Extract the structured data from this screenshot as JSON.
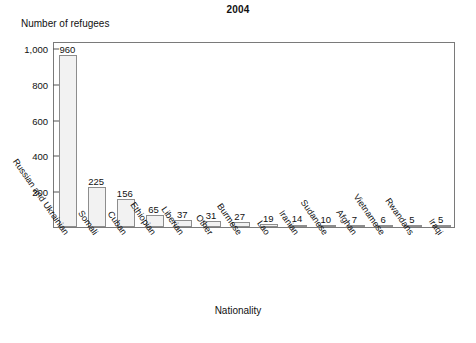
{
  "chart_data": {
    "type": "bar",
    "title": "2004",
    "xlabel": "Nationality",
    "ylabel": "Number of refugees",
    "ylim": [
      0,
      1040
    ],
    "yticks": [
      200,
      400,
      600,
      800,
      1000
    ],
    "ytick_labels": [
      "200",
      "400",
      "600",
      "800",
      "1,000"
    ],
    "grid": false,
    "legend": null,
    "categories": [
      "Russian and Ukrainian",
      "Somali",
      "Cuban",
      "Ethiopian",
      "Liberian",
      "Other",
      "Burmese",
      "Lao",
      "Iranian",
      "Sudanese",
      "Afghan",
      "Vietnamese",
      "Rwandans",
      "Iraqi"
    ],
    "values": [
      960,
      225,
      156,
      65,
      37,
      31,
      27,
      19,
      14,
      10,
      7,
      6,
      5,
      5
    ],
    "value_labels": [
      "960",
      "225",
      "156",
      "65",
      "37",
      "31",
      "27",
      "19",
      "14",
      "10",
      "7",
      "6",
      "5",
      "5"
    ],
    "bar_fill": "#f2f2f2",
    "bar_stroke": "#8d8d8d",
    "frame_color": "#7a7a7a",
    "text_color": "#111111"
  }
}
